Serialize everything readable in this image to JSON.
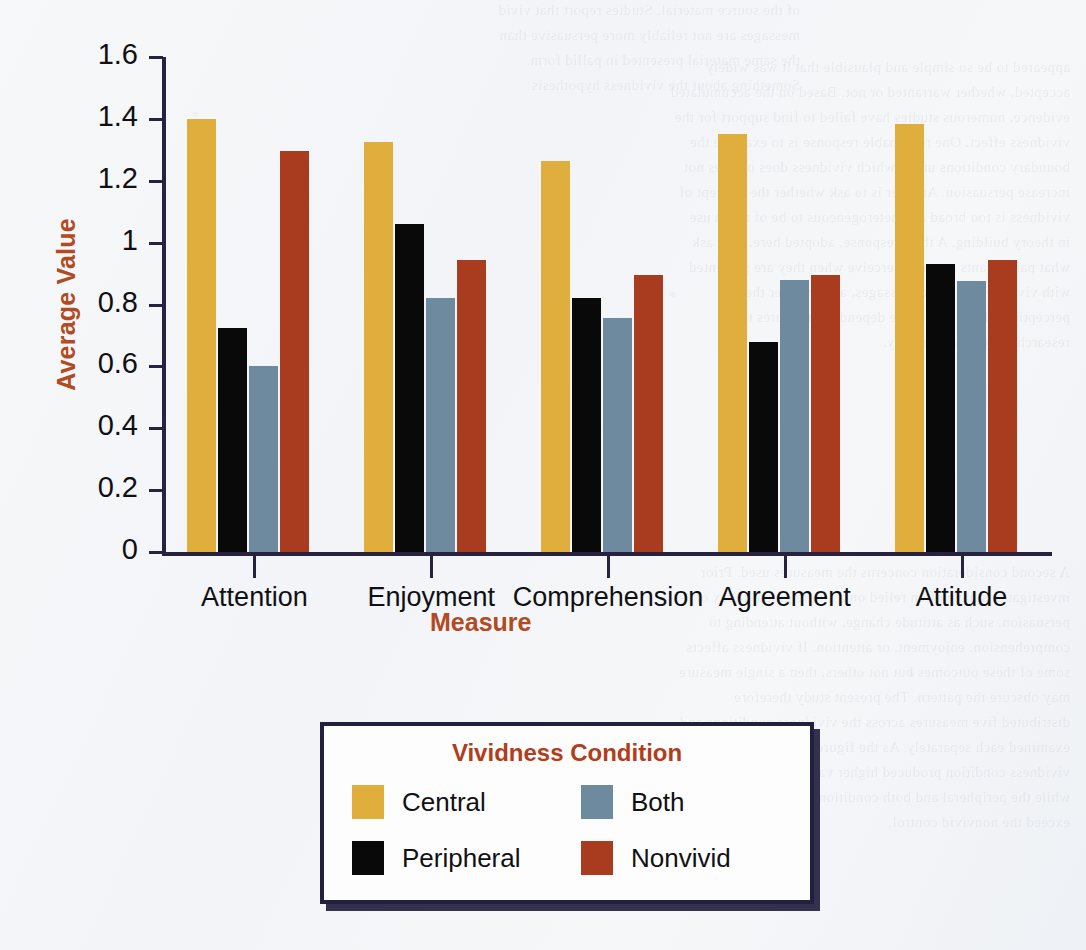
{
  "chart_data": {
    "type": "bar",
    "title": "",
    "xlabel": "Measure",
    "ylabel": "Average Value",
    "ylim": [
      0,
      1.6
    ],
    "yticks": [
      "0",
      "0.2",
      "0.4",
      "0.6",
      "0.8",
      "1",
      "1.2",
      "1.4",
      "1.6"
    ],
    "grid": false,
    "legend_position": "bottom-center",
    "legend_title": "Vividness Condition",
    "categories": [
      "Attention",
      "Enjoyment",
      "Comprehension",
      "Agreement",
      "Attitude"
    ],
    "series": [
      {
        "name": "Central",
        "color": "#E0AE3C",
        "values": [
          1.4,
          1.325,
          1.265,
          1.35,
          1.385
        ]
      },
      {
        "name": "Peripheral",
        "color": "#090909",
        "values": [
          0.725,
          1.06,
          0.82,
          0.68,
          0.93
        ]
      },
      {
        "name": "Both",
        "color": "#6E8A9E",
        "values": [
          0.6,
          0.82,
          0.755,
          0.88,
          0.875
        ]
      },
      {
        "name": "Nonvivid",
        "color": "#A93B1E",
        "values": [
          1.295,
          0.945,
          0.895,
          0.895,
          0.945
        ]
      }
    ]
  },
  "axis": {
    "axis_color": "#262240",
    "label_color": "#b24a22"
  },
  "legend": {
    "title": "Vividness Condition",
    "border_color": "#23203f",
    "items": [
      {
        "label": "Central",
        "color": "#E0AE3C"
      },
      {
        "label": "Both",
        "color": "#6E8A9E"
      },
      {
        "label": "Peripheral",
        "color": "#090909"
      },
      {
        "label": "Nonvivid",
        "color": "#A93B1E"
      }
    ]
  },
  "background": {
    "ghost_text_top": "of the source material. Studies report that vivid\nmessages are not reliably more persuasive than\nthe same material presented in pallid form.\nSomething about the vividness hypothesis",
    "ghost_text_right": "appeared to be so simple and plausible that it was widely\naccepted, whether warranted or not. Based on the accumulated\nevidence, numerous studies have failed to find support for the\nvividness effect. One reasonable response is to examine the\nboundary conditions under which vividness does or does not\nincrease persuasion. Another is to ask whether the concept of\nvividness is too broad and heterogeneous to be of much use\nin theory building. A third response, adopted here, is to ask\nwhat participants actually perceive when they are presented\nwith vivid versus pallid messages, and whether these\nperceptions differ across the dependent measures that\nresearchers typically employ.",
    "ghost_text_bottom": "A second consideration concerns the measures used. Prior\ninvestigations have often relied on a single global index of\npersuasion, such as attitude change, without attending to\ncomprehension, enjoyment, or attention. If vividness affects\nsome of these outcomes but not others, then a single measure\nmay obscure the pattern. The present study therefore\ndistributed five measures across the vividness conditions and\nexamined each separately. As the figure shows, the central\nvividness condition produced higher values on every measure,\nwhile the peripheral and both conditions did not reliably\nexceed the nonvivid control."
  }
}
